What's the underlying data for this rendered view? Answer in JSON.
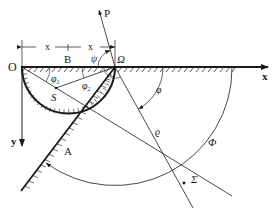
{
  "figure": {
    "type": "geometric-diagram"
  },
  "labels": {
    "origin": "O",
    "B": "B",
    "Omega": "Ω",
    "P": "P",
    "x_axis": "x",
    "y_axis": "y",
    "S": "S",
    "A": "A",
    "Sigma": "Σ",
    "psi": "ψ",
    "phi1": "φ",
    "phi1_sub": "1",
    "phi2": "φ",
    "phi2_sub": "2",
    "phi": "φ",
    "rho": "ϱ",
    "Phi": "Φ",
    "dim_x1": "x",
    "dim_x2": "x"
  },
  "colors": {
    "stroke": "#1a1a1a",
    "background": "#ffffff"
  }
}
